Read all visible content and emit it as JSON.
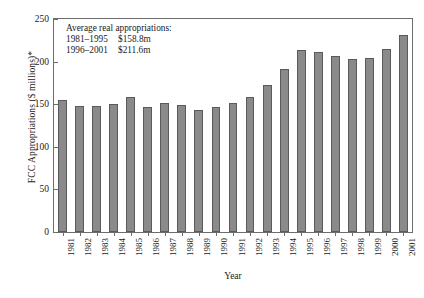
{
  "chart_data": {
    "type": "bar",
    "title": "",
    "xlabel": "Year",
    "ylabel": "FCC Appropriations ($ millions)*",
    "ylim": [
      0,
      250
    ],
    "yticks": [
      0,
      50,
      100,
      150,
      200,
      250
    ],
    "grid": false,
    "legend": null,
    "bar_color": "#8a8a8a",
    "bar_edge_color": "#5a5a5a",
    "categories": [
      "1981",
      "1982",
      "1983",
      "1984",
      "1985",
      "1986",
      "1987",
      "1988",
      "1989",
      "1990",
      "1991",
      "1992",
      "1993",
      "1994",
      "1995",
      "1996",
      "1997",
      "1998",
      "1999",
      "2000",
      "2001"
    ],
    "values": [
      155,
      148,
      148,
      150,
      158,
      147,
      152,
      149,
      143,
      147,
      152,
      159,
      172,
      191,
      214,
      211,
      207,
      203,
      204,
      215,
      231
    ],
    "annotations": {
      "title": "Average real appropriations:",
      "rows": [
        {
          "period": "1981–1995",
          "amount": "$158.8m"
        },
        {
          "period": "1996–2001",
          "amount": "$211.6m"
        }
      ]
    }
  }
}
